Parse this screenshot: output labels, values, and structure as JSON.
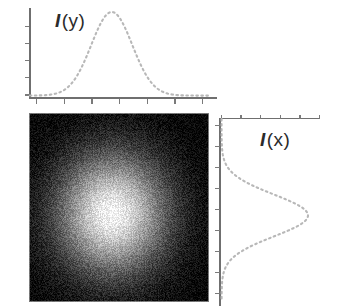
{
  "figure": {
    "background_color": "#ffffff",
    "panels": [
      {
        "id": "top-profile",
        "role": "horizontal-marginal-profile",
        "label": "I (y)",
        "label_symbol": "I",
        "label_argument": "(y)"
      },
      {
        "id": "image-2d",
        "role": "two-dimensional-intensity-image"
      },
      {
        "id": "right-profile",
        "role": "vertical-marginal-profile",
        "label": "I (x)",
        "label_symbol": "I",
        "label_argument": "(x)"
      }
    ]
  },
  "labels": {
    "top_symbol": "I",
    "top_arg": "(y)",
    "right_symbol": "I",
    "right_arg": "(x)"
  },
  "colors": {
    "curve": "#b8b8b8",
    "axis": "#6f6f6f",
    "tick": "#7a7a7a",
    "label_text": "#2b2b2b",
    "image_background": "#050505",
    "image_peak": "#f2f2f2",
    "page_background": "#ffffff"
  },
  "chart_data": [
    {
      "type": "line",
      "id": "top-profile",
      "title": "I (y)",
      "xlabel": "",
      "ylabel": "I (y)",
      "linestyle": "dashed",
      "grid": false,
      "legend": "none",
      "axis_labels_shown": false,
      "xlim": [
        0,
        1
      ],
      "ylim": [
        0,
        1
      ],
      "description": "Dashed Gaussian marginal intensity profile along y, peak left of panel centre.",
      "gaussian": {
        "amplitude": 1.0,
        "center": 0.46,
        "sigma": 0.115,
        "baseline": 0.02
      },
      "x": [
        0.0,
        0.05,
        0.1,
        0.15,
        0.2,
        0.25,
        0.3,
        0.35,
        0.4,
        0.45,
        0.5,
        0.55,
        0.6,
        0.65,
        0.7,
        0.75,
        0.8,
        0.85,
        0.9,
        0.95,
        1.0
      ],
      "values": [
        0.02,
        0.02,
        0.02,
        0.03,
        0.05,
        0.1,
        0.23,
        0.44,
        0.71,
        0.94,
        0.99,
        0.84,
        0.58,
        0.33,
        0.15,
        0.06,
        0.03,
        0.02,
        0.02,
        0.02,
        0.02
      ],
      "ticks": {
        "x_count": 7,
        "y_count": 5,
        "x_labels": [],
        "y_labels": []
      }
    },
    {
      "type": "line",
      "id": "right-profile",
      "title": "I (x)",
      "xlabel": "I (x)",
      "ylabel": "",
      "linestyle": "dashed",
      "grid": false,
      "legend": "none",
      "axis_labels_shown": false,
      "orientation": "vertical",
      "xlim": [
        0,
        1
      ],
      "ylim": [
        0,
        1
      ],
      "description": "Dashed Gaussian marginal intensity profile along x, plotted sideways; peak slightly below panel centre.",
      "gaussian": {
        "amplitude": 1.0,
        "center": 0.53,
        "sigma": 0.115,
        "baseline": 0.02
      },
      "y": [
        0.0,
        0.05,
        0.1,
        0.15,
        0.2,
        0.25,
        0.3,
        0.35,
        0.4,
        0.45,
        0.5,
        0.55,
        0.6,
        0.65,
        0.7,
        0.75,
        0.8,
        0.85,
        0.9,
        0.95,
        1.0
      ],
      "values": [
        0.02,
        0.02,
        0.02,
        0.02,
        0.03,
        0.05,
        0.11,
        0.26,
        0.5,
        0.77,
        0.96,
        1.0,
        0.88,
        0.64,
        0.38,
        0.18,
        0.07,
        0.03,
        0.02,
        0.02,
        0.02
      ],
      "ticks": {
        "x_count": 6,
        "y_count": 9,
        "x_labels": [],
        "y_labels": []
      }
    },
    {
      "type": "heatmap",
      "id": "image-2d",
      "title": "",
      "xlabel": "",
      "ylabel": "",
      "colormap": "gray",
      "noise": "speckle",
      "description": "Noisy grayscale 2D Gaussian spot (bright blob) on a dark background; spot centre slightly left of and below the panel centre.",
      "gaussian_2d": {
        "amplitude": 1.0,
        "center_x": 0.46,
        "center_y": 0.53,
        "sigma_x": 0.21,
        "sigma_y": 0.22
      },
      "value_range": [
        0,
        1
      ],
      "grid": false
    }
  ]
}
